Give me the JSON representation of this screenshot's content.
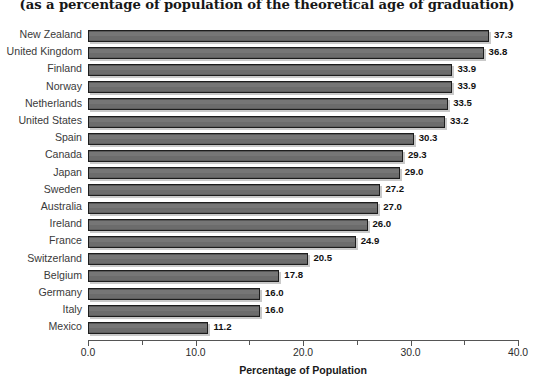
{
  "chart_data": {
    "type": "bar",
    "orientation": "horizontal",
    "title": "",
    "subtitle": "(as a percentage of population of the theoretical age of graduation)",
    "xlabel": "Percentage of Population",
    "ylabel": "",
    "xlim": [
      0.0,
      40.0
    ],
    "xticks": [
      "0.0",
      "10.0",
      "20.0",
      "30.0",
      "40.0"
    ],
    "xtick_values": [
      0,
      10,
      20,
      30,
      40
    ],
    "minor_tick_values": [
      5,
      15,
      25,
      35
    ],
    "grid": false,
    "legend": null,
    "bar_color": "#6e6e6e",
    "bar_edge_color": "#1d1d1d",
    "categories": [
      "New Zealand",
      "United Kingdom",
      "Finland",
      "Norway",
      "Netherlands",
      "United States",
      "Spain",
      "Canada",
      "Japan",
      "Sweden",
      "Australia",
      "Ireland",
      "France",
      "Switzerland",
      "Belgium",
      "Germany",
      "Italy",
      "Mexico"
    ],
    "values": [
      37.3,
      36.8,
      33.9,
      33.9,
      33.5,
      33.2,
      30.3,
      29.3,
      29.0,
      27.2,
      27.0,
      26.0,
      24.9,
      20.5,
      17.8,
      16.0,
      16.0,
      11.2
    ],
    "value_labels": [
      "37.3",
      "36.8",
      "33.9",
      "33.9",
      "33.5",
      "33.2",
      "30.3",
      "29.3",
      "29.0",
      "27.2",
      "27.0",
      "26.0",
      "24.9",
      "20.5",
      "17.8",
      "16.0",
      "16.0",
      "11.2"
    ]
  }
}
